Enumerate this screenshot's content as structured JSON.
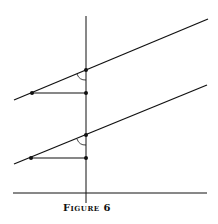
{
  "figure": {
    "caption": "Figure 6",
    "vertical_axis": {
      "x": 86,
      "y1": 16,
      "y2": 203
    },
    "baseline": {
      "y": 193,
      "x1": 13,
      "x2": 207
    },
    "slanted_lines": [
      {
        "x1": 14,
        "y1": 100,
        "x2": 208,
        "y2": 19,
        "intersect": {
          "x": 86,
          "y": 70
        },
        "foot_left": {
          "x": 32,
          "y": 93
        },
        "foot_right": {
          "x": 86,
          "y": 93
        }
      },
      {
        "x1": 14,
        "y1": 164,
        "x2": 207,
        "y2": 85,
        "intersect": {
          "x": 86,
          "y": 135
        },
        "foot_left": {
          "x": 31,
          "y": 158
        },
        "foot_right": {
          "x": 86,
          "y": 158
        }
      }
    ],
    "colors": {
      "stroke": "#111111",
      "background": "#ffffff"
    }
  }
}
